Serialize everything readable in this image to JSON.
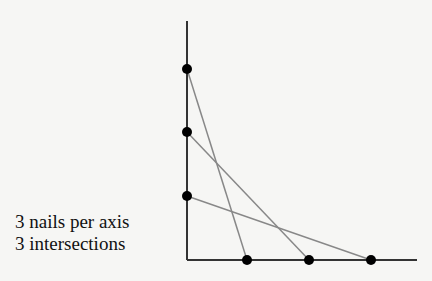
{
  "caption": {
    "line1": "3 nails per axis",
    "line2": "3 intersections"
  },
  "diagram": {
    "nails_per_axis": 3,
    "intersections": 3,
    "origin": [
      187,
      260
    ],
    "y_axis_top": 21,
    "x_axis_end": 417,
    "y_nails": [
      [
        187,
        69
      ],
      [
        187,
        132
      ],
      [
        187,
        196
      ]
    ],
    "x_nails": [
      [
        247,
        260
      ],
      [
        309,
        260
      ],
      [
        371,
        260
      ]
    ],
    "strings": [
      {
        "from": [
          187,
          69
        ],
        "to": [
          247,
          260
        ]
      },
      {
        "from": [
          187,
          132
        ],
        "to": [
          309,
          260
        ]
      },
      {
        "from": [
          187,
          196
        ],
        "to": [
          371,
          260
        ]
      }
    ],
    "colors": {
      "axis": "#333333",
      "string": "#888888",
      "nail": "#000000"
    }
  }
}
